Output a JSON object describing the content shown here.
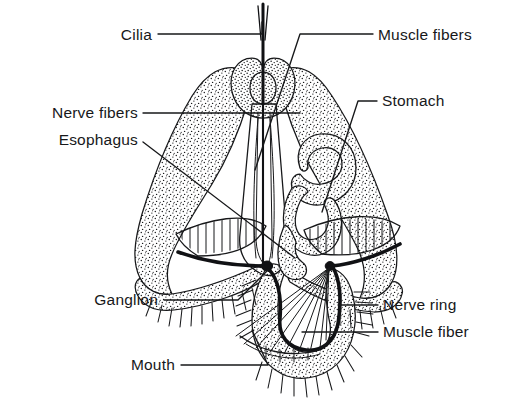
{
  "figure": {
    "kind": "biological-anatomy-diagram",
    "background_color": "#ffffff",
    "ink_color": "#17181a",
    "stipple_color": "#17181a",
    "width": 521,
    "height": 407
  },
  "labels": [
    {
      "id": "cilia",
      "text": "Cilia",
      "side": "left",
      "text_x": 152,
      "text_y": 40,
      "leader": "M158,34 L262,34 L262,22",
      "target": "apical ciliary tuft"
    },
    {
      "id": "nerve-fibers",
      "text": "Nerve fibers",
      "side": "left",
      "text_x": 138,
      "text_y": 118,
      "leader": "M143,113 L300,113",
      "target": "nerve fibers running along esophagus"
    },
    {
      "id": "esophagus",
      "text": "Esophagus",
      "side": "left",
      "text_x": 138,
      "text_y": 145,
      "leader": "M143,142 L295,258",
      "target": "esophageal funnel"
    },
    {
      "id": "ganglion",
      "text": "Ganglion",
      "side": "left",
      "text_x": 158,
      "text_y": 305,
      "leader": "M164,300 L238,300 L268,270",
      "target": "left ganglion on nerve ring"
    },
    {
      "id": "mouth",
      "text": "Mouth",
      "side": "left",
      "text_x": 175,
      "text_y": 370,
      "leader": "M181,365 L268,365 L252,330",
      "target": "mouth opening"
    },
    {
      "id": "muscle-fibers",
      "text": "Muscle fibers",
      "side": "right",
      "text_x": 378,
      "text_y": 40,
      "leader": "M373,34 L300,34 L255,170",
      "target": "longitudinal muscle fibers"
    },
    {
      "id": "stomach",
      "text": "Stomach",
      "side": "right",
      "text_x": 382,
      "text_y": 106,
      "leader": "M377,101 L358,101 L322,212",
      "target": "coiled stomach lumen"
    },
    {
      "id": "nerve-ring",
      "text": "Nerve ring",
      "side": "right",
      "text_x": 383,
      "text_y": 310,
      "leader": "M378,305 L338,305",
      "target": "circumoral nerve ring"
    },
    {
      "id": "muscle-fiber",
      "text": "Muscle fiber",
      "side": "right",
      "text_x": 383,
      "text_y": 337,
      "leader": "M378,332 L302,332",
      "target": "single radial muscle fiber in fan"
    }
  ],
  "structures": [
    {
      "id": "body-wall",
      "name": "stippled body wall"
    },
    {
      "id": "apex-collar",
      "name": "apical collar around ciliary tuft"
    },
    {
      "id": "cilia-tuft",
      "name": "apical ciliary tuft"
    },
    {
      "id": "esophagus-funnel",
      "name": "esophagus"
    },
    {
      "id": "stomach-coil",
      "name": "stomach"
    },
    {
      "id": "left-arm",
      "name": "left lateral arm"
    },
    {
      "id": "right-arm",
      "name": "right lateral arm"
    },
    {
      "id": "striated-band-left",
      "name": "left striated muscle band"
    },
    {
      "id": "striated-band-right",
      "name": "right striated muscle band"
    },
    {
      "id": "nerve-ring-arc",
      "name": "nerve ring"
    },
    {
      "id": "muscle-fan",
      "name": "radial muscle fiber fan"
    },
    {
      "id": "ciliary-fringe",
      "name": "ciliary fringe"
    },
    {
      "id": "ganglion-left",
      "name": "left ganglion"
    },
    {
      "id": "ganglion-right",
      "name": "right ganglion"
    }
  ]
}
